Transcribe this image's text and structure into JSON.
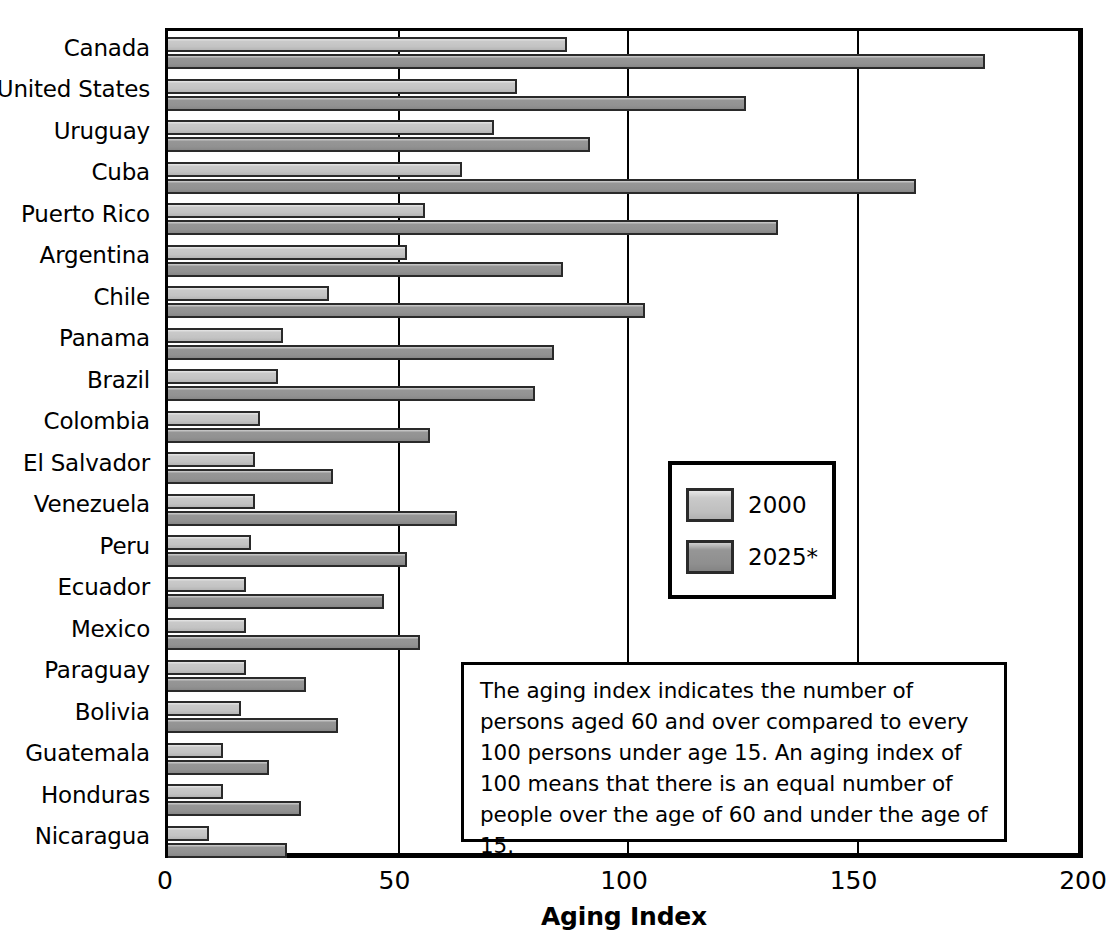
{
  "chart_data": {
    "type": "bar",
    "orientation": "horizontal",
    "title": "",
    "xlabel": "Aging Index",
    "ylabel": "",
    "xlim": [
      0,
      200
    ],
    "xticks": [
      0,
      50,
      100,
      150,
      200
    ],
    "grid": true,
    "legend_position": "center-right",
    "categories": [
      "Canada",
      "United States",
      "Uruguay",
      "Cuba",
      "Puerto Rico",
      "Argentina",
      "Chile",
      "Panama",
      "Brazil",
      "Colombia",
      "El Salvador",
      "Venezuela",
      "Peru",
      "Ecuador",
      "Mexico",
      "Paraguay",
      "Bolivia",
      "Guatemala",
      "Honduras",
      "Nicaragua"
    ],
    "series": [
      {
        "name": "2000",
        "color": "#c9c9c9",
        "values": [
          87,
          76,
          71,
          64,
          56,
          52,
          35,
          25,
          24,
          20,
          19,
          19,
          18,
          17,
          17,
          17,
          16,
          12,
          12,
          9
        ]
      },
      {
        "name": "2025*",
        "color": "#969696",
        "values": [
          178,
          126,
          92,
          163,
          133,
          86,
          104,
          84,
          80,
          57,
          36,
          63,
          52,
          47,
          55,
          30,
          37,
          22,
          29,
          26
        ]
      }
    ],
    "note": "The aging index indicates the number of persons aged 60 and over compared to every 100 persons under age 15. An aging index of 100 means that there is an equal number of people over the age of 60 and under the age of 15."
  },
  "legend": {
    "items": [
      {
        "label": "2000"
      },
      {
        "label": "2025*"
      }
    ]
  },
  "axis": {
    "x_title": "Aging Index",
    "tick_labels": [
      "0",
      "50",
      "100",
      "150",
      "200"
    ]
  }
}
